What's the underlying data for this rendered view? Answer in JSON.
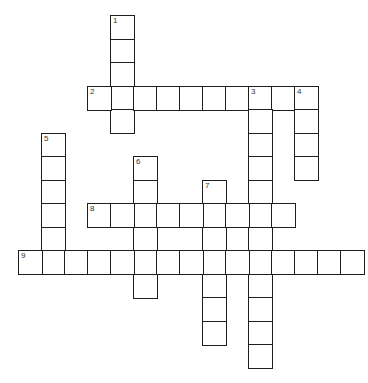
{
  "puzzle": {
    "type": "crossword",
    "grid": {
      "origin_x": 18,
      "origin_y": 15,
      "cell_width": 23,
      "cell_height": 23.5,
      "columns": 15,
      "rows": 15,
      "line_color": "#1e1e1e",
      "number_color": "#333333",
      "background": "#ffffff"
    },
    "words": [
      {
        "number": 1,
        "direction": "down",
        "row": 0,
        "col": 4,
        "length": 5,
        "answer": ""
      },
      {
        "number": 2,
        "direction": "across",
        "row": 3,
        "col": 3,
        "length": 10,
        "answer": ""
      },
      {
        "number": 3,
        "direction": "down",
        "row": 3,
        "col": 10,
        "length": 12,
        "answer": ""
      },
      {
        "number": 4,
        "direction": "down",
        "row": 3,
        "col": 12,
        "length": 4,
        "answer": ""
      },
      {
        "number": 5,
        "direction": "down",
        "row": 5,
        "col": 1,
        "length": 6,
        "answer": ""
      },
      {
        "number": 6,
        "direction": "down",
        "row": 6,
        "col": 5,
        "length": 6,
        "answer": ""
      },
      {
        "number": 7,
        "direction": "down",
        "row": 7,
        "col": 8,
        "length": 7,
        "answer": ""
      },
      {
        "number": 8,
        "direction": "across",
        "row": 8,
        "col": 3,
        "length": 9,
        "answer": ""
      },
      {
        "number": 9,
        "direction": "across",
        "row": 10,
        "col": 0,
        "length": 15,
        "answer": ""
      }
    ]
  }
}
